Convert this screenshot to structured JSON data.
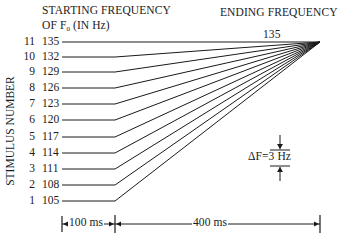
{
  "header": {
    "starting_line1": "STARTING FREQUENCY",
    "starting_line2_prefix": "OF F",
    "starting_line2_sub": "0",
    "starting_line2_suffix": " (IN Hz)",
    "ending": "ENDING FREQUENCY",
    "ending_value": "135"
  },
  "axis": {
    "ylabel": "STIMULUS NUMBER"
  },
  "stimuli": [
    {
      "number": "11",
      "start_hz": "135",
      "y": 42
    },
    {
      "number": "10",
      "start_hz": "132",
      "y": 57
    },
    {
      "number": "9",
      "start_hz": "129",
      "y": 72
    },
    {
      "number": "8",
      "start_hz": "126",
      "y": 88
    },
    {
      "number": "7",
      "start_hz": "123",
      "y": 104
    },
    {
      "number": "6",
      "start_hz": "120",
      "y": 120
    },
    {
      "number": "5",
      "start_hz": "117",
      "y": 137
    },
    {
      "number": "4",
      "start_hz": "114",
      "y": 153
    },
    {
      "number": "3",
      "start_hz": "111",
      "y": 169
    },
    {
      "number": "2",
      "start_hz": "108",
      "y": 185
    },
    {
      "number": "1",
      "start_hz": "105",
      "y": 201
    }
  ],
  "delta": {
    "prefix": "ΔF=",
    "value": "3 Hz"
  },
  "timescale": {
    "first": "100 ms",
    "second": "400 ms"
  },
  "geometry": {
    "line_start_x": 62,
    "bend_x": 115,
    "end_x": 320,
    "end_y": 42
  }
}
